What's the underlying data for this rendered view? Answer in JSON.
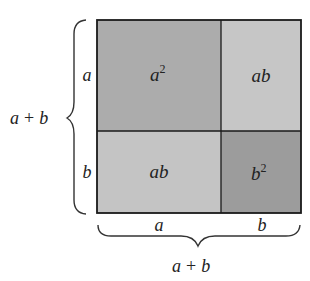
{
  "diagram": {
    "colors": {
      "a_squared": "#acacac",
      "ab_top": "#c6c6c6",
      "ab_bottom": "#c4c4c4",
      "b_squared": "#9c9c9c",
      "border": "#1a1a1a",
      "brace": "#333333"
    },
    "regions": [
      {
        "id": "a_squared",
        "label_base": "a",
        "label_exp": "2"
      },
      {
        "id": "ab_top",
        "label": "ab"
      },
      {
        "id": "ab_bottom",
        "label": "ab"
      },
      {
        "id": "b_squared",
        "label_base": "b",
        "label_exp": "2"
      }
    ],
    "left_side": {
      "segment_labels": [
        "a",
        "b"
      ],
      "total_label": {
        "a": "a",
        "plus": "+",
        "b": "b"
      }
    },
    "bottom_side": {
      "segment_labels": [
        "a",
        "b"
      ],
      "total_label": {
        "a": "a",
        "plus": "+",
        "b": "b"
      }
    }
  }
}
